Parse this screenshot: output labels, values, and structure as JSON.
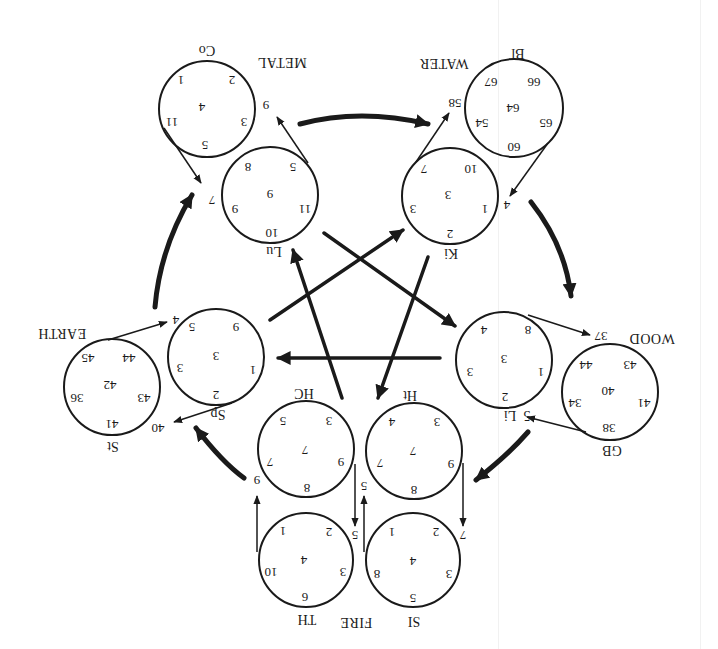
{
  "diagram": {
    "orientation": "rotated-180",
    "colors": {
      "ink": "#1a1a1a",
      "background": "#ffffff"
    },
    "elements": {
      "metal": "METAL",
      "water": "WATER",
      "wood": "WOOD",
      "fire": "FIRE",
      "earth": "EARTH"
    },
    "meridians": {
      "co": {
        "label": "Co",
        "center": "4",
        "points": [
          "1",
          "2",
          "3",
          "5",
          "11"
        ]
      },
      "lu": {
        "label": "Lu",
        "center": "9",
        "points": [
          "8",
          "5",
          "11",
          "10",
          "9"
        ]
      },
      "bl": {
        "label": "Bl",
        "center": "64",
        "points": [
          "66",
          "67",
          "54",
          "65",
          "60"
        ]
      },
      "ki": {
        "label": "Ki",
        "center": "3",
        "points": [
          "10",
          "7",
          "3",
          "1",
          "2"
        ]
      },
      "li": {
        "label": "Li",
        "center": "3",
        "points": [
          "8",
          "4",
          "3",
          "1",
          "2"
        ]
      },
      "gb": {
        "label": "GB",
        "center": "40",
        "points": [
          "43",
          "44",
          "34",
          "41",
          "38"
        ]
      },
      "sp": {
        "label": "Sp",
        "center": "3",
        "points": [
          "9",
          "5",
          "3",
          "1",
          "2"
        ]
      },
      "st": {
        "label": "St",
        "center": "42",
        "points": [
          "44",
          "45",
          "36",
          "43",
          "41"
        ]
      },
      "hc": {
        "label": "HC",
        "center": "7",
        "points": [
          "3",
          "5",
          "7",
          "9",
          "8"
        ]
      },
      "ht": {
        "label": "Ht",
        "center": "7",
        "points": [
          "3",
          "4",
          "7",
          "9",
          "8"
        ]
      },
      "th": {
        "label": "TH",
        "center": "4",
        "points": [
          "2",
          "1",
          "3",
          "10",
          "6"
        ]
      },
      "si": {
        "label": "SI",
        "center": "4",
        "points": [
          "2",
          "1",
          "3",
          "8",
          "5"
        ]
      }
    },
    "connector_labels": {
      "metal_in": "7",
      "metal_out": "9",
      "water_in": "4",
      "water_out": "58",
      "wood_in": "5",
      "wood_out": "37",
      "li_prefix": "5",
      "fire_in_si": "7",
      "fire_hc_to_th": "5",
      "fire_si_to_ht": "5",
      "fire_out": "9",
      "earth_in": "40",
      "earth_out": "4"
    }
  }
}
